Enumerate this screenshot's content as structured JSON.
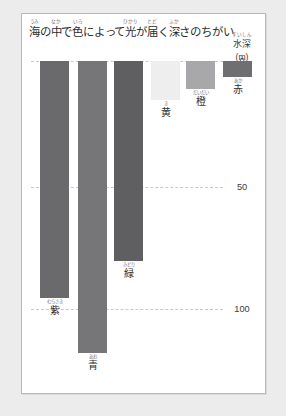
{
  "card": {
    "background": "#ffffff",
    "border_color": "#b9b9bb"
  },
  "title": {
    "full_text": "海の中で色によって光が届く深さのちがい",
    "segments": [
      {
        "base": "海",
        "ruby": "うみ"
      },
      {
        "base": "の",
        "ruby": ""
      },
      {
        "base": "中",
        "ruby": "なか"
      },
      {
        "base": "で",
        "ruby": ""
      },
      {
        "base": "色",
        "ruby": "いろ"
      },
      {
        "base": "によって",
        "ruby": ""
      },
      {
        "base": "光",
        "ruby": "ひかり"
      },
      {
        "base": "が",
        "ruby": ""
      },
      {
        "base": "届",
        "ruby": "とど"
      },
      {
        "base": "く",
        "ruby": ""
      },
      {
        "base": "深",
        "ruby": "ふか"
      },
      {
        "base": "さのちがい",
        "ruby": ""
      }
    ]
  },
  "axis_caption": {
    "label": "水深",
    "label_ruby": "すいしん",
    "unit": "(m)"
  },
  "chart_data": {
    "type": "bar",
    "xlabel": "",
    "ylabel": "水深 (m)",
    "ylim": [
      0,
      125
    ],
    "y_inverted": true,
    "grid": true,
    "legend": "none",
    "tick_labels": [
      "0",
      "50",
      "100"
    ],
    "tick_values": [
      0,
      50,
      100
    ],
    "categories": [
      "紫",
      "青",
      "緑",
      "黄",
      "橙",
      "赤"
    ],
    "category_rubies": [
      "むらさき",
      "あお",
      "みどり",
      "き",
      "だいだい",
      "あか"
    ],
    "values": [
      95,
      117,
      80,
      16,
      12,
      7
    ],
    "colors": [
      "#6a6a6c",
      "#767678",
      "#5f5f61",
      "#eeeeee",
      "#a8a8aa",
      "#6f6f71"
    ]
  },
  "bars": [
    {
      "name": "purple",
      "label": "紫",
      "ruby": "むらさき",
      "depth_m": 95,
      "color": "#6a6a6c",
      "x": 18,
      "width": 29,
      "bottom_px": 284
    },
    {
      "name": "blue",
      "label": "青",
      "ruby": "あお",
      "depth_m": 117,
      "color": "#767678",
      "x": 56,
      "width": 29,
      "bottom_px": 339
    },
    {
      "name": "green",
      "label": "緑",
      "ruby": "みどり",
      "depth_m": 80,
      "color": "#5f5f61",
      "x": 92,
      "width": 29,
      "bottom_px": 247
    },
    {
      "name": "yellow",
      "label": "黄",
      "ruby": "き",
      "depth_m": 16,
      "color": "#eeeeee",
      "x": 129,
      "width": 29,
      "bottom_px": 86
    },
    {
      "name": "orange",
      "label": "橙",
      "ruby": "だいだい",
      "depth_m": 12,
      "color": "#a8a8aa",
      "x": 164,
      "width": 29,
      "bottom_px": 75
    },
    {
      "name": "red",
      "label": "赤",
      "ruby": "あか",
      "depth_m": 7,
      "color": "#6f6f71",
      "x": 201,
      "width": 29,
      "bottom_px": 63
    }
  ],
  "gridlines": [
    {
      "value": "0",
      "y": 47
    },
    {
      "value": "50",
      "y": 173
    },
    {
      "value": "100",
      "y": 295
    }
  ]
}
